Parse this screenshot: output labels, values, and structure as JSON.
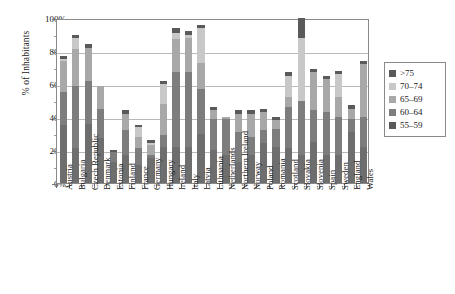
{
  "chart_data": {
    "type": "bar",
    "stacked": true,
    "title": "",
    "xlabel": "",
    "ylabel": "% of Inhabitants",
    "ylim": [
      0,
      100
    ],
    "ytick_labels": [
      "0%",
      "20%",
      "40%",
      "60%",
      "80%",
      "100%"
    ],
    "ytick_values": [
      0,
      20,
      40,
      60,
      80,
      100
    ],
    "grid": true,
    "legend_position": "right",
    "categories": [
      "Austria",
      "Bulgaria",
      "Czech Republic",
      "Denmark",
      "Estonia",
      "Finland",
      "France",
      "Germany",
      "Hungary",
      "Ireland",
      "Italy",
      "Latvia",
      "Lithuania",
      "Netherlands",
      "Northern Ireland",
      "Norway",
      "Poland",
      "Romania",
      "Scotland",
      "Slovakia",
      "Slovenia",
      "Spain",
      "Sweden",
      "England",
      "Wales"
    ],
    "series": [
      {
        "name": "55-59",
        "color": "#6e6e6e",
        "values": [
          35,
          21,
          36,
          27,
          13,
          17,
          11,
          15,
          22,
          22,
          22,
          30,
          20,
          17,
          13,
          17,
          24,
          22,
          21,
          17,
          25,
          17,
          17,
          31,
          22
        ]
      },
      {
        "name": "60-64",
        "color": "#7d7d7d",
        "values": [
          20,
          38,
          26,
          18,
          6,
          15,
          10,
          2,
          7,
          45,
          45,
          27,
          19,
          22,
          18,
          11,
          8,
          11,
          25,
          33,
          19,
          26,
          23,
          8,
          18
        ]
      },
      {
        "name": "65-69",
        "color": "#a8a8a8",
        "values": [
          19,
          22,
          20,
          14,
          0,
          10,
          7,
          6,
          19,
          20,
          21,
          16,
          5,
          1,
          11,
          14,
          11,
          5,
          6,
          0,
          23,
          20,
          12,
          6,
          32
        ]
      },
      {
        "name": "70-74",
        "color": "#c8c8c8",
        "values": [
          1,
          7,
          0,
          0,
          0,
          0,
          6,
          1,
          12,
          4,
          2,
          21,
          0,
          0,
          0,
          0,
          0,
          0,
          13,
          38,
          0,
          0,
          14,
          0,
          0
        ]
      },
      {
        "name": ">75",
        "color": "#5a5a5a",
        "values": [
          2,
          2,
          2,
          0,
          1,
          2,
          1,
          2,
          2,
          3,
          2,
          2,
          2,
          0,
          2,
          2,
          2,
          2,
          2,
          12,
          2,
          2,
          2,
          2,
          2
        ]
      }
    ]
  },
  "legend": {
    "entries": [
      {
        "label": ">75",
        "color": "#5a5a5a"
      },
      {
        "label": "70–74",
        "color": "#c8c8c8"
      },
      {
        "label": "65–69",
        "color": "#a8a8a8"
      },
      {
        "label": "60–64",
        "color": "#7d7d7d"
      },
      {
        "label": "55–59",
        "color": "#5a5a5a"
      }
    ]
  },
  "axis": {
    "y_title": "% of Inhabitants"
  }
}
